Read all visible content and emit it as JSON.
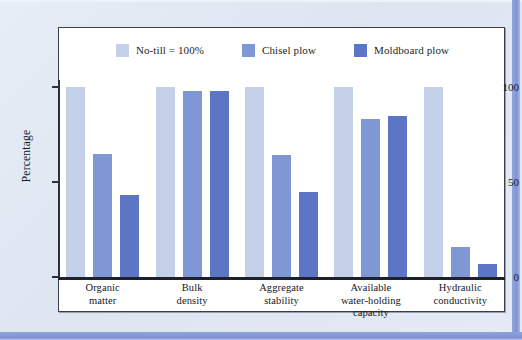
{
  "figure": {
    "background_color": "#e2e9f4",
    "accent_band_color": "#7e93d6",
    "frame_border_color": "#3a3f4a"
  },
  "chart_data": {
    "type": "bar",
    "title": "",
    "subtitle": "",
    "xlabel": "",
    "ylabel": "Percentage",
    "ylim": [
      0,
      110
    ],
    "yticks": [
      0,
      50,
      100
    ],
    "ytick_labels": [
      "0",
      "50",
      "100"
    ],
    "grid": false,
    "legend_position": "top-center",
    "categories": [
      "Organic matter",
      "Bulk density",
      "Aggregate stability",
      "Available water-holding capacity",
      "Hydraulic conductivity"
    ],
    "category_lines": [
      [
        "Organic",
        "matter"
      ],
      [
        "Bulk",
        "density"
      ],
      [
        "Aggregate",
        "stability"
      ],
      [
        "Available",
        "water-holding",
        "capacity"
      ],
      [
        "Hydraulic",
        "conductivity"
      ]
    ],
    "series": [
      {
        "name": "No-till = 100%",
        "color": "#c3d0e8",
        "values": [
          100,
          100,
          100,
          100,
          100
        ]
      },
      {
        "name": "Chisel plow",
        "color": "#7f97d4",
        "values": [
          65,
          98,
          64,
          83,
          16
        ]
      },
      {
        "name": "Moldboard plow",
        "color": "#5c75c4",
        "values": [
          43,
          98,
          45,
          85,
          7
        ]
      }
    ]
  },
  "legend": {
    "entries": [
      {
        "label": "No-till = 100%",
        "color": "#c3d0e8"
      },
      {
        "label": "Chisel plow",
        "color": "#7f97d4"
      },
      {
        "label": "Moldboard plow",
        "color": "#5c75c4"
      }
    ]
  }
}
